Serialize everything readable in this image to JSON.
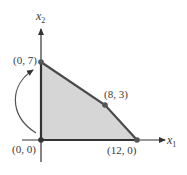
{
  "diagram": {
    "axes": {
      "x_label": "x",
      "x_sub": "1",
      "y_label": "x",
      "y_sub": "2"
    },
    "vertices": [
      {
        "label": "(0, 0)",
        "x": 0,
        "y": 0
      },
      {
        "label": "(0, 7)",
        "x": 0,
        "y": 7
      },
      {
        "label": "(8, 3)",
        "x": 8,
        "y": 3
      },
      {
        "label": "(12, 0)",
        "x": 12,
        "y": 0
      }
    ],
    "feasible_region_color": "#d6d6d6",
    "line_color": "#4a4a4a",
    "annotation": "curved arrow from (0, 0) to (0, 7)"
  }
}
